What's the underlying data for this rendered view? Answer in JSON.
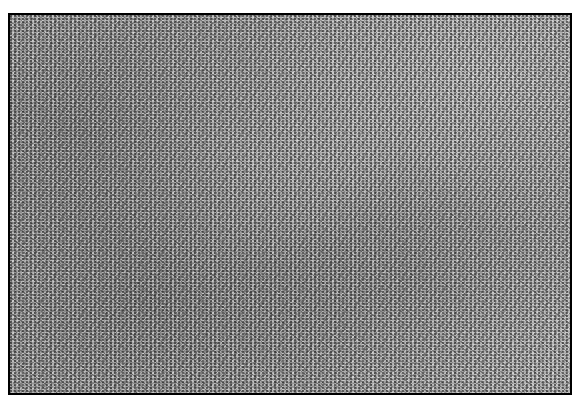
{
  "caption": {
    "visible_text": "",
    "note_cut_off": true
  },
  "figure": {
    "kind": "grayscale micrograph texture",
    "border_color": "#000000",
    "dominant_tone": "#a0a0a0"
  }
}
